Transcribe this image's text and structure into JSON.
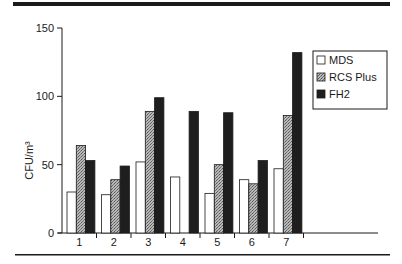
{
  "chart_data": {
    "type": "bar",
    "title": "",
    "xlabel": "",
    "ylabel": "CFU/m³",
    "ylim": [
      0,
      150
    ],
    "yticks": [
      0,
      50,
      100,
      150
    ],
    "categories": [
      "1",
      "2",
      "3",
      "4",
      "5",
      "6",
      "7"
    ],
    "series": [
      {
        "name": "MDS",
        "pattern": "white",
        "values": [
          30,
          28,
          52,
          41,
          29,
          39,
          47
        ]
      },
      {
        "name": "RCS Plus",
        "pattern": "stipple",
        "values": [
          64,
          39,
          89,
          null,
          50,
          36,
          86
        ]
      },
      {
        "name": "FH2",
        "pattern": "black",
        "values": [
          53,
          49,
          99,
          89,
          88,
          53,
          132
        ]
      }
    ],
    "legend": {
      "position": "top-right",
      "entries": [
        "MDS",
        "RCS Plus",
        "FH2"
      ]
    },
    "grid": false
  }
}
